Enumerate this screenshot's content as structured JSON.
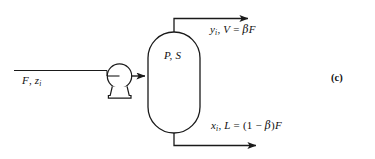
{
  "figure": {
    "kind": "process-flow-diagram",
    "part_label": "(c)",
    "stroke_color": "#1a1a1a",
    "background_color": "#ffffff",
    "equipment": {
      "vessel": {
        "name": "flash-drum",
        "interior_label": "P, S"
      },
      "pump": {
        "name": "pump",
        "symbol": "circle-on-pedestal"
      }
    },
    "streams": {
      "feed": {
        "name": "feed-stream",
        "label_main": "F",
        "label_comma": ",",
        "label_var": "z",
        "label_sub": "i"
      },
      "vapor": {
        "name": "vapor-stream",
        "var": "y",
        "var_sub": "i",
        "comma": ",",
        "flow": "V",
        "equals": "=",
        "beta": "β",
        "basis": "F"
      },
      "liquid": {
        "name": "liquid-stream",
        "var": "x",
        "var_sub": "i",
        "comma": ",",
        "flow": "L",
        "equals": "=",
        "open_paren": "(1",
        "minus": "−",
        "beta": "β",
        "close_paren": ")",
        "basis": "F"
      }
    }
  }
}
